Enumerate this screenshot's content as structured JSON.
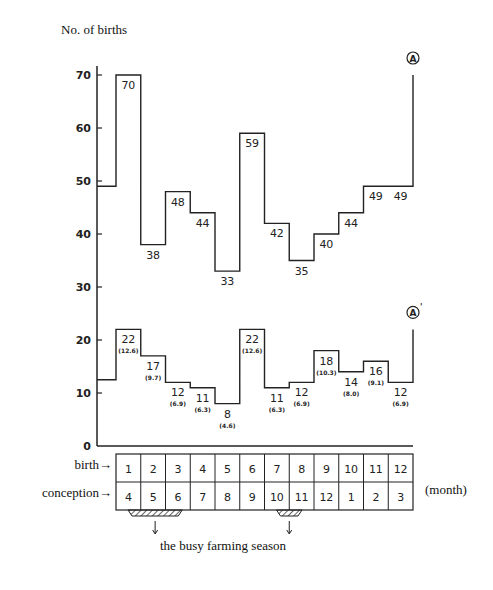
{
  "chart_data": {
    "type": "line",
    "subtype": "step",
    "title": "",
    "ylabel": "No. of births",
    "xlabel": "(month)",
    "ylim": [
      0,
      70
    ],
    "yticks": [
      0,
      10,
      20,
      30,
      40,
      50,
      60,
      70
    ],
    "grid": false,
    "categories_birth_month": [
      "1",
      "2",
      "3",
      "4",
      "5",
      "6",
      "7",
      "8",
      "9",
      "10",
      "11",
      "12"
    ],
    "categories_conception_month": [
      "4",
      "5",
      "6",
      "7",
      "8",
      "9",
      "10",
      "11",
      "12",
      "1",
      "2",
      "3"
    ],
    "series": [
      {
        "name": "A",
        "label": "Ⓐ",
        "values": [
          70,
          38,
          48,
          44,
          33,
          59,
          42,
          35,
          40,
          44,
          49,
          49
        ],
        "start_value": 49,
        "end_value": 70
      },
      {
        "name": "A'",
        "label": "Ⓐ'",
        "values": [
          22,
          17,
          12,
          11,
          8,
          22,
          11,
          12,
          18,
          14,
          16,
          12
        ],
        "percentages": [
          "12.6",
          "9.7",
          "6.9",
          "6.3",
          "4.6",
          "12.6",
          "6.3",
          "6.9",
          "10.3",
          "8.0",
          "9.1",
          "6.9"
        ],
        "start_value": 12.5,
        "end_value": 22
      }
    ],
    "annotations": [
      {
        "text": "the busy farming season",
        "covers_birth_months": [
          1,
          2,
          3
        ],
        "covers_conception_months": [
          4,
          5,
          6
        ]
      },
      {
        "text": "the busy farming season",
        "covers_birth_months": [
          7,
          8
        ],
        "covers_conception_months": [
          10,
          11
        ]
      }
    ]
  },
  "labels": {
    "y_axis_title": "No. of births",
    "row_birth": "birth→",
    "row_conception": "conception→",
    "month_unit": "(month)",
    "busy_season": "the busy farming season",
    "series_a": "A",
    "series_a_prime": "A'"
  }
}
